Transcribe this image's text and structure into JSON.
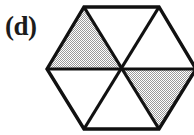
{
  "figure": {
    "label": "(d)",
    "shape_name": "hexagon",
    "background_color": "#ffffff",
    "stroke_color": "#111111",
    "stroke_width": 3.2,
    "shaded_fill_color": "#c9c9c9",
    "unshaded_fill_color": "#ffffff",
    "label_color": "#1c1c1c",
    "vertices": {
      "left": [
        47,
        69
      ],
      "top_left": [
        84,
        7
      ],
      "top_right": [
        159,
        7
      ],
      "right": [
        196,
        69
      ],
      "bottom_right": [
        159,
        129
      ],
      "bottom_left": [
        84,
        129
      ],
      "center": [
        121.5,
        69
      ]
    },
    "sectors": [
      {
        "name": "upper-left-triangle",
        "points": "47,69 84,7 121.5,69",
        "shaded": true
      },
      {
        "name": "upper-middle-triangle",
        "points": "84,7 159,7 121.5,69",
        "shaded": false
      },
      {
        "name": "upper-right-triangle",
        "points": "159,7 196,69 121.5,69",
        "shaded": false
      },
      {
        "name": "lower-right-triangle",
        "points": "196,69 159,129 121.5,69",
        "shaded": true
      },
      {
        "name": "lower-middle-triangle",
        "points": "159,129 84,129 121.5,69",
        "shaded": false
      },
      {
        "name": "lower-left-triangle",
        "points": "84,129 47,69 121.5,69",
        "shaded": false
      }
    ],
    "diagonals": [
      {
        "name": "horizontal-diagonal",
        "from": [
          47,
          69
        ],
        "to": [
          196,
          69
        ]
      },
      {
        "name": "upper-left-to-lower-right-diagonal",
        "from": [
          84,
          7
        ],
        "to": [
          159,
          129
        ]
      },
      {
        "name": "upper-right-to-lower-left-diagonal",
        "from": [
          159,
          7
        ],
        "to": [
          84,
          129
        ]
      }
    ],
    "shaded_count": 2,
    "total_sectors": 6
  }
}
